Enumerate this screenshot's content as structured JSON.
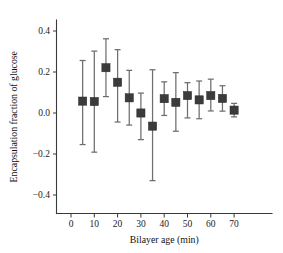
{
  "chart_data": {
    "type": "scatter",
    "title": "",
    "xlabel": "Bilayer age (min)",
    "ylabel": "Encapsulation fraction of glucose",
    "xlim": [
      -3,
      75
    ],
    "ylim": [
      -0.47,
      0.45
    ],
    "xticks": [
      0,
      10,
      20,
      30,
      40,
      50,
      60,
      70
    ],
    "xtick_labels": [
      "0",
      "10",
      "20",
      "30",
      "40",
      "50",
      "60",
      "70"
    ],
    "yticks": [
      -0.4,
      -0.2,
      0.0,
      0.2,
      0.4
    ],
    "ytick_labels": [
      "−0.4",
      "−0.2",
      "0.0",
      "0.2",
      "0.4"
    ],
    "grid": false,
    "legend": null,
    "marker_style": "square",
    "marker_color": "#3b3b3b",
    "errorbar_color": "#6e6e6e",
    "x": [
      5,
      10,
      15,
      20,
      25,
      30,
      35,
      40,
      45,
      50,
      55,
      60,
      65,
      70
    ],
    "values": [
      0.058,
      0.056,
      0.221,
      0.15,
      0.074,
      0.0,
      -0.064,
      0.07,
      0.052,
      0.085,
      0.064,
      0.085,
      0.071,
      0.014
    ],
    "yerr_upper": [
      0.198,
      0.246,
      0.141,
      0.159,
      0.134,
      0.097,
      0.275,
      0.082,
      0.145,
      0.063,
      0.092,
      0.08,
      0.062,
      0.033
    ],
    "yerr_lower": [
      0.212,
      0.247,
      0.141,
      0.194,
      0.133,
      0.13,
      0.266,
      0.082,
      0.141,
      0.109,
      0.092,
      0.075,
      0.062,
      0.033
    ],
    "upper_bounds": [
      0.256,
      0.302,
      0.362,
      0.309,
      0.208,
      0.097,
      0.211,
      0.152,
      0.197,
      0.148,
      0.156,
      0.165,
      0.133,
      0.047
    ],
    "lower_bounds": [
      -0.154,
      -0.191,
      0.08,
      -0.044,
      -0.059,
      -0.13,
      -0.33,
      -0.012,
      -0.089,
      -0.024,
      -0.028,
      0.01,
      0.009,
      -0.019
    ]
  },
  "figure": {
    "background_color": "#ffffff",
    "axis_color": "#3a3a3a"
  }
}
